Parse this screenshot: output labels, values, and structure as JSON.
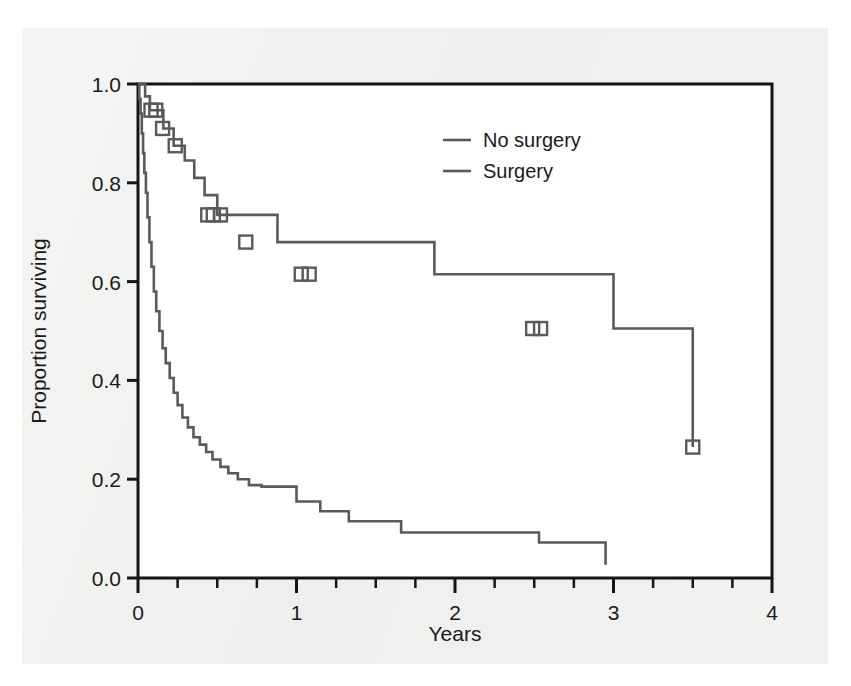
{
  "chart_data": {
    "type": "line",
    "title": "",
    "subtitle": "",
    "xlabel": "Years",
    "ylabel": "Proportion surviving",
    "xlim": [
      0,
      4
    ],
    "ylim": [
      0,
      1
    ],
    "xticks": [
      0,
      1,
      2,
      3,
      4
    ],
    "xtick_labels": [
      "0",
      "1",
      "2",
      "3",
      "4"
    ],
    "xminor_step": 0.25,
    "yticks": [
      0.0,
      0.2,
      0.4,
      0.6,
      0.8,
      1.0
    ],
    "ytick_labels": [
      "0.0",
      "0.2",
      "0.4",
      "0.6",
      "0.8",
      "1.0"
    ],
    "grid": false,
    "legend_position": "upper-center-right",
    "step_style": "post",
    "line_color": "#5a5a5a",
    "axis_color": "#151515",
    "censor_marker": "open-square",
    "series": [
      {
        "name": "No surgery",
        "color": "#5a5a5a",
        "x": [
          0,
          0.008,
          0.016,
          0.024,
          0.032,
          0.04,
          0.05,
          0.06,
          0.072,
          0.085,
          0.1,
          0.115,
          0.135,
          0.155,
          0.175,
          0.2,
          0.225,
          0.25,
          0.28,
          0.315,
          0.35,
          0.39,
          0.43,
          0.47,
          0.52,
          0.57,
          0.63,
          0.7,
          0.78,
          0.88,
          1.0,
          1.15,
          1.33,
          1.66,
          2.53,
          2.95
        ],
        "y": [
          1.0,
          0.97,
          0.94,
          0.9,
          0.86,
          0.82,
          0.78,
          0.73,
          0.68,
          0.63,
          0.58,
          0.54,
          0.5,
          0.465,
          0.435,
          0.405,
          0.375,
          0.35,
          0.325,
          0.305,
          0.285,
          0.27,
          0.255,
          0.24,
          0.225,
          0.212,
          0.2,
          0.188,
          0.185,
          0.185,
          0.155,
          0.135,
          0.115,
          0.092,
          0.072,
          0.027
        ],
        "censor_x": [],
        "censor_y": []
      },
      {
        "name": "Surgery",
        "color": "#5a5a5a",
        "x": [
          0,
          0.045,
          0.075,
          0.115,
          0.16,
          0.225,
          0.295,
          0.355,
          0.42,
          0.5,
          0.88,
          1.87,
          3.0,
          3.5
        ],
        "y": [
          1.0,
          0.975,
          0.947,
          0.947,
          0.91,
          0.875,
          0.845,
          0.81,
          0.775,
          0.735,
          0.68,
          0.615,
          0.505,
          0.265
        ],
        "censor_x": [
          0.082,
          0.112,
          0.155,
          0.235,
          0.44,
          0.475,
          0.52,
          0.68,
          1.03,
          1.08,
          2.49,
          2.54,
          3.5
        ],
        "censor_y": [
          0.947,
          0.947,
          0.91,
          0.875,
          0.735,
          0.735,
          0.735,
          0.68,
          0.615,
          0.615,
          0.505,
          0.505,
          0.265
        ]
      }
    ],
    "legend_entries": [
      {
        "label": "No surgery",
        "color": "#5a5a5a"
      },
      {
        "label": "Surgery",
        "color": "#5a5a5a"
      }
    ]
  }
}
